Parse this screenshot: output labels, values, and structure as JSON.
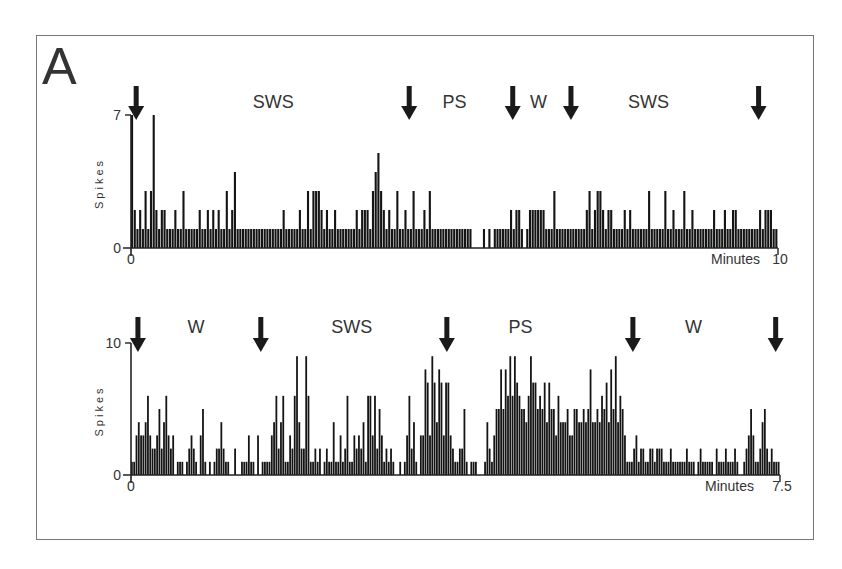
{
  "panel_label": "A",
  "chart_data": [
    {
      "type": "bar",
      "title": "",
      "xlabel": "Minutes",
      "ylabel": "Spikes",
      "xlim": [
        0,
        10
      ],
      "ylim": [
        0,
        7
      ],
      "x_ticks": [
        "0",
        "10"
      ],
      "y_ticks": [
        "0",
        "7"
      ],
      "state_labels": [
        {
          "label": "SWS",
          "x_min": 2.2
        },
        {
          "label": "PS",
          "x_min": 5.0
        },
        {
          "label": "W",
          "x_min": 6.3
        },
        {
          "label": "SWS",
          "x_min": 8.0
        }
      ],
      "arrows_x_min": [
        0.08,
        4.3,
        5.9,
        6.8,
        9.7
      ],
      "bin_values": [
        7,
        2,
        1,
        2,
        1,
        3,
        1,
        3,
        7,
        2,
        1,
        2,
        2,
        1,
        1,
        1,
        2,
        1,
        1,
        3,
        1,
        1,
        1,
        1,
        1,
        2,
        1,
        1,
        2,
        1,
        2,
        1,
        2,
        1,
        1,
        3,
        1,
        2,
        4,
        1,
        1,
        1,
        1,
        1,
        1,
        1,
        1,
        1,
        1,
        1,
        1,
        1,
        1,
        1,
        1,
        1,
        2,
        1,
        1,
        1,
        1,
        1,
        2,
        1,
        1,
        3,
        1,
        3,
        3,
        3,
        2,
        1,
        2,
        1,
        1,
        2,
        1,
        1,
        1,
        1,
        1,
        1,
        1,
        2,
        1,
        2,
        2,
        2,
        1,
        3,
        4,
        5,
        3,
        2,
        1,
        2,
        1,
        1,
        3,
        1,
        1,
        2,
        1,
        1,
        3,
        1,
        1,
        1,
        2,
        1,
        3,
        1,
        1,
        1,
        1,
        1,
        1,
        1,
        1,
        1,
        1,
        1,
        1,
        1,
        1,
        1,
        0,
        0,
        0,
        0,
        1,
        0,
        1,
        0,
        1,
        1,
        1,
        1,
        1,
        1,
        2,
        1,
        2,
        2,
        1,
        0,
        1,
        2,
        2,
        2,
        2,
        2,
        2,
        1,
        1,
        1,
        3,
        1,
        1,
        1,
        1,
        1,
        1,
        1,
        1,
        1,
        1,
        1,
        2,
        3,
        1,
        2,
        3,
        3,
        2,
        1,
        2,
        2,
        1,
        1,
        1,
        1,
        2,
        1,
        2,
        1,
        1,
        1,
        1,
        1,
        1,
        3,
        1,
        1,
        1,
        1,
        1,
        3,
        1,
        1,
        2,
        1,
        1,
        1,
        3,
        1,
        1,
        2,
        1,
        1,
        1,
        1,
        1,
        1,
        1,
        2,
        1,
        1,
        1,
        2,
        1,
        1,
        2,
        2,
        1,
        1,
        1,
        1,
        1,
        1,
        1,
        1,
        2,
        1,
        2,
        2,
        2,
        1,
        1
      ]
    },
    {
      "type": "bar",
      "title": "",
      "xlabel": "Minutes",
      "ylabel": "Spikes",
      "xlim": [
        0,
        7.5
      ],
      "ylim": [
        0,
        10
      ],
      "x_ticks": [
        "0",
        "7.5"
      ],
      "y_ticks": [
        "0",
        "10"
      ],
      "state_labels": [
        {
          "label": "W",
          "x_min": 0.75
        },
        {
          "label": "SWS",
          "x_min": 2.55
        },
        {
          "label": "PS",
          "x_min": 4.5
        },
        {
          "label": "W",
          "x_min": 6.5
        }
      ],
      "arrows_x_min": [
        0.08,
        1.5,
        3.65,
        5.8,
        7.45
      ],
      "bin_values": [
        1,
        1,
        3,
        4,
        3,
        3,
        4,
        6,
        3,
        2,
        2,
        3,
        5,
        2,
        4,
        6,
        3,
        2,
        3,
        0,
        1,
        1,
        1,
        0,
        1,
        2,
        3,
        2,
        1,
        0,
        3,
        5,
        1,
        0,
        1,
        0,
        1,
        2,
        2,
        4,
        2,
        1,
        1,
        0,
        0,
        2,
        0,
        0,
        1,
        1,
        1,
        3,
        1,
        1,
        0,
        3,
        0,
        1,
        1,
        1,
        1,
        3,
        4,
        6,
        2,
        4,
        6,
        1,
        1,
        3,
        2,
        6,
        9,
        4,
        2,
        2,
        9,
        6,
        1,
        1,
        2,
        1,
        2,
        0,
        1,
        2,
        1,
        1,
        4,
        1,
        1,
        3,
        1,
        2,
        6,
        1,
        1,
        3,
        2,
        3,
        2,
        4,
        1,
        6,
        6,
        3,
        6,
        2,
        5,
        3,
        1,
        2,
        1,
        2,
        1,
        0,
        0,
        1,
        0,
        1,
        3,
        6,
        2,
        4,
        1,
        0,
        3,
        3,
        8,
        7,
        3,
        9,
        7,
        4,
        8,
        7,
        3,
        7,
        7,
        3,
        2,
        1,
        1,
        2,
        2,
        5,
        1,
        0,
        1,
        1,
        1,
        0,
        0,
        0,
        1,
        4,
        2,
        1,
        3,
        5,
        5,
        8,
        5,
        8,
        6,
        9,
        6,
        9,
        7,
        6,
        5,
        5,
        4,
        6,
        9,
        7,
        7,
        5,
        6,
        5,
        7,
        4,
        7,
        5,
        5,
        3,
        6,
        4,
        4,
        4,
        5,
        3,
        3,
        5,
        5,
        4,
        4,
        5,
        4,
        5,
        8,
        4,
        4,
        5,
        4,
        6,
        5,
        7,
        4,
        8,
        5,
        9,
        4,
        6,
        5,
        3,
        1,
        1,
        1,
        2,
        3,
        1,
        2,
        2,
        1,
        1,
        2,
        2,
        1,
        2,
        2,
        2,
        1,
        1,
        1,
        2,
        1,
        1,
        1,
        1,
        1,
        1,
        2,
        1,
        1,
        1,
        0,
        1,
        2,
        1,
        1,
        1,
        1,
        1,
        0,
        2,
        1,
        1,
        1,
        2,
        1,
        1,
        1,
        2,
        1,
        0,
        0,
        1,
        2,
        3,
        5,
        3,
        1,
        1,
        2,
        4,
        5,
        2,
        1,
        2,
        1,
        1,
        1
      ]
    }
  ]
}
